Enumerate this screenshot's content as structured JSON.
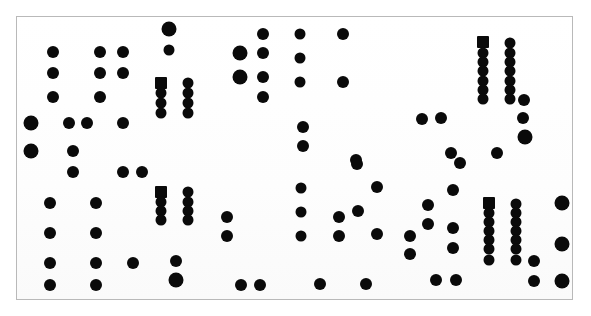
{
  "figure": {
    "type": "scatter-dot-plot",
    "background_color": "#ffffff",
    "frame_color": "#b9b9b9",
    "mark_color": "#0a0a0a",
    "frame": {
      "x": 16,
      "y": 16,
      "width": 557,
      "height": 284
    }
  },
  "chart_data": {
    "type": "scatter",
    "title": "",
    "subtitle": "",
    "xlabel": "",
    "ylabel": "",
    "xlim": [
      0,
      591
    ],
    "ylim": [
      0,
      316
    ],
    "grid": false,
    "legend": "none",
    "annotations": [],
    "tick_labels": {
      "x": [],
      "y": []
    },
    "marker_shapes": [
      "circle",
      "square"
    ],
    "marker_sizes_px": {
      "small": 9,
      "medium": 12,
      "large": 16
    },
    "point_count": 118,
    "points": [
      {
        "x": 53,
        "y": 52,
        "r": 6,
        "shape": "circle"
      },
      {
        "x": 100,
        "y": 52,
        "r": 6,
        "shape": "circle"
      },
      {
        "x": 123,
        "y": 52,
        "r": 6,
        "shape": "circle"
      },
      {
        "x": 169,
        "y": 29,
        "r": 7.5,
        "shape": "circle"
      },
      {
        "x": 169,
        "y": 50,
        "r": 5.5,
        "shape": "circle"
      },
      {
        "x": 240,
        "y": 53,
        "r": 7.5,
        "shape": "circle"
      },
      {
        "x": 263,
        "y": 34,
        "r": 6,
        "shape": "circle"
      },
      {
        "x": 263,
        "y": 53,
        "r": 6,
        "shape": "circle"
      },
      {
        "x": 300,
        "y": 34,
        "r": 5.5,
        "shape": "circle"
      },
      {
        "x": 343,
        "y": 34,
        "r": 6,
        "shape": "circle"
      },
      {
        "x": 483,
        "y": 42,
        "r": 6,
        "shape": "square"
      },
      {
        "x": 510,
        "y": 43,
        "r": 5.5,
        "shape": "circle"
      },
      {
        "x": 53,
        "y": 73,
        "r": 6,
        "shape": "circle"
      },
      {
        "x": 100,
        "y": 73,
        "r": 6,
        "shape": "circle"
      },
      {
        "x": 123,
        "y": 73,
        "r": 6,
        "shape": "circle"
      },
      {
        "x": 240,
        "y": 77,
        "r": 7.5,
        "shape": "circle"
      },
      {
        "x": 263,
        "y": 77,
        "r": 6,
        "shape": "circle"
      },
      {
        "x": 300,
        "y": 58,
        "r": 5.5,
        "shape": "circle"
      },
      {
        "x": 483,
        "y": 53,
        "r": 5.5,
        "shape": "circle"
      },
      {
        "x": 510,
        "y": 53,
        "r": 5.5,
        "shape": "circle"
      },
      {
        "x": 161,
        "y": 83,
        "r": 6,
        "shape": "square"
      },
      {
        "x": 188,
        "y": 83,
        "r": 5.5,
        "shape": "circle"
      },
      {
        "x": 300,
        "y": 82,
        "r": 5.5,
        "shape": "circle"
      },
      {
        "x": 343,
        "y": 82,
        "r": 6,
        "shape": "circle"
      },
      {
        "x": 483,
        "y": 62,
        "r": 5.5,
        "shape": "circle"
      },
      {
        "x": 510,
        "y": 62,
        "r": 5.5,
        "shape": "circle"
      },
      {
        "x": 53,
        "y": 97,
        "r": 6,
        "shape": "circle"
      },
      {
        "x": 100,
        "y": 97,
        "r": 6,
        "shape": "circle"
      },
      {
        "x": 161,
        "y": 93,
        "r": 5.5,
        "shape": "circle"
      },
      {
        "x": 188,
        "y": 93,
        "r": 5.5,
        "shape": "circle"
      },
      {
        "x": 263,
        "y": 97,
        "r": 6,
        "shape": "circle"
      },
      {
        "x": 483,
        "y": 71,
        "r": 5.5,
        "shape": "circle"
      },
      {
        "x": 510,
        "y": 71,
        "r": 5.5,
        "shape": "circle"
      },
      {
        "x": 161,
        "y": 103,
        "r": 5.5,
        "shape": "circle"
      },
      {
        "x": 188,
        "y": 103,
        "r": 5.5,
        "shape": "circle"
      },
      {
        "x": 483,
        "y": 81,
        "r": 5.5,
        "shape": "circle"
      },
      {
        "x": 510,
        "y": 81,
        "r": 5.5,
        "shape": "circle"
      },
      {
        "x": 161,
        "y": 113,
        "r": 5.5,
        "shape": "circle"
      },
      {
        "x": 188,
        "y": 113,
        "r": 5.5,
        "shape": "circle"
      },
      {
        "x": 483,
        "y": 90,
        "r": 5.5,
        "shape": "circle"
      },
      {
        "x": 510,
        "y": 90,
        "r": 5.5,
        "shape": "circle"
      },
      {
        "x": 31,
        "y": 123,
        "r": 7.5,
        "shape": "circle"
      },
      {
        "x": 69,
        "y": 123,
        "r": 6,
        "shape": "circle"
      },
      {
        "x": 87,
        "y": 123,
        "r": 6,
        "shape": "circle"
      },
      {
        "x": 123,
        "y": 123,
        "r": 6,
        "shape": "circle"
      },
      {
        "x": 303,
        "y": 127,
        "r": 6,
        "shape": "circle"
      },
      {
        "x": 422,
        "y": 119,
        "r": 6,
        "shape": "circle"
      },
      {
        "x": 441,
        "y": 118,
        "r": 6,
        "shape": "circle"
      },
      {
        "x": 483,
        "y": 99,
        "r": 5.5,
        "shape": "circle"
      },
      {
        "x": 510,
        "y": 99,
        "r": 5.5,
        "shape": "circle"
      },
      {
        "x": 524,
        "y": 100,
        "r": 6,
        "shape": "circle"
      },
      {
        "x": 31,
        "y": 151,
        "r": 7.5,
        "shape": "circle"
      },
      {
        "x": 73,
        "y": 151,
        "r": 6,
        "shape": "circle"
      },
      {
        "x": 303,
        "y": 146,
        "r": 6,
        "shape": "circle"
      },
      {
        "x": 356,
        "y": 160,
        "r": 6,
        "shape": "circle"
      },
      {
        "x": 451,
        "y": 153,
        "r": 6,
        "shape": "circle"
      },
      {
        "x": 497,
        "y": 153,
        "r": 6,
        "shape": "circle"
      },
      {
        "x": 523,
        "y": 118,
        "r": 6,
        "shape": "circle"
      },
      {
        "x": 525,
        "y": 137,
        "r": 7.5,
        "shape": "circle"
      },
      {
        "x": 73,
        "y": 172,
        "r": 6,
        "shape": "circle"
      },
      {
        "x": 123,
        "y": 172,
        "r": 6,
        "shape": "circle"
      },
      {
        "x": 142,
        "y": 172,
        "r": 6,
        "shape": "circle"
      },
      {
        "x": 357,
        "y": 164,
        "r": 6,
        "shape": "circle"
      },
      {
        "x": 460,
        "y": 163,
        "r": 6,
        "shape": "circle"
      },
      {
        "x": 50,
        "y": 203,
        "r": 6,
        "shape": "circle"
      },
      {
        "x": 96,
        "y": 203,
        "r": 6,
        "shape": "circle"
      },
      {
        "x": 161,
        "y": 192,
        "r": 6,
        "shape": "square"
      },
      {
        "x": 188,
        "y": 192,
        "r": 5.5,
        "shape": "circle"
      },
      {
        "x": 301,
        "y": 188,
        "r": 5.5,
        "shape": "circle"
      },
      {
        "x": 377,
        "y": 187,
        "r": 6,
        "shape": "circle"
      },
      {
        "x": 489,
        "y": 203,
        "r": 6,
        "shape": "square"
      },
      {
        "x": 516,
        "y": 204,
        "r": 5.5,
        "shape": "circle"
      },
      {
        "x": 562,
        "y": 203,
        "r": 7.5,
        "shape": "circle"
      },
      {
        "x": 453,
        "y": 190,
        "r": 6,
        "shape": "circle"
      },
      {
        "x": 161,
        "y": 202,
        "r": 5.5,
        "shape": "circle"
      },
      {
        "x": 188,
        "y": 202,
        "r": 5.5,
        "shape": "circle"
      },
      {
        "x": 358,
        "y": 211,
        "r": 6,
        "shape": "circle"
      },
      {
        "x": 339,
        "y": 217,
        "r": 6,
        "shape": "circle"
      },
      {
        "x": 227,
        "y": 217,
        "r": 6,
        "shape": "circle"
      },
      {
        "x": 428,
        "y": 205,
        "r": 6,
        "shape": "circle"
      },
      {
        "x": 489,
        "y": 213,
        "r": 5.5,
        "shape": "circle"
      },
      {
        "x": 516,
        "y": 213,
        "r": 5.5,
        "shape": "circle"
      },
      {
        "x": 50,
        "y": 233,
        "r": 6,
        "shape": "circle"
      },
      {
        "x": 96,
        "y": 233,
        "r": 6,
        "shape": "circle"
      },
      {
        "x": 161,
        "y": 211,
        "r": 5.5,
        "shape": "circle"
      },
      {
        "x": 188,
        "y": 211,
        "r": 5.5,
        "shape": "circle"
      },
      {
        "x": 301,
        "y": 212,
        "r": 5.5,
        "shape": "circle"
      },
      {
        "x": 489,
        "y": 222,
        "r": 5.5,
        "shape": "circle"
      },
      {
        "x": 516,
        "y": 222,
        "r": 5.5,
        "shape": "circle"
      },
      {
        "x": 161,
        "y": 220,
        "r": 5.5,
        "shape": "circle"
      },
      {
        "x": 188,
        "y": 220,
        "r": 5.5,
        "shape": "circle"
      },
      {
        "x": 227,
        "y": 236,
        "r": 6,
        "shape": "circle"
      },
      {
        "x": 301,
        "y": 236,
        "r": 5.5,
        "shape": "circle"
      },
      {
        "x": 339,
        "y": 236,
        "r": 6,
        "shape": "circle"
      },
      {
        "x": 377,
        "y": 234,
        "r": 6,
        "shape": "circle"
      },
      {
        "x": 410,
        "y": 236,
        "r": 6,
        "shape": "circle"
      },
      {
        "x": 428,
        "y": 224,
        "r": 6,
        "shape": "circle"
      },
      {
        "x": 453,
        "y": 228,
        "r": 6,
        "shape": "circle"
      },
      {
        "x": 489,
        "y": 231,
        "r": 5.5,
        "shape": "circle"
      },
      {
        "x": 516,
        "y": 231,
        "r": 5.5,
        "shape": "circle"
      },
      {
        "x": 50,
        "y": 263,
        "r": 6,
        "shape": "circle"
      },
      {
        "x": 96,
        "y": 263,
        "r": 6,
        "shape": "circle"
      },
      {
        "x": 133,
        "y": 263,
        "r": 6,
        "shape": "circle"
      },
      {
        "x": 176,
        "y": 261,
        "r": 6,
        "shape": "circle"
      },
      {
        "x": 410,
        "y": 254,
        "r": 6,
        "shape": "circle"
      },
      {
        "x": 453,
        "y": 248,
        "r": 6,
        "shape": "circle"
      },
      {
        "x": 489,
        "y": 240,
        "r": 5.5,
        "shape": "circle"
      },
      {
        "x": 516,
        "y": 240,
        "r": 5.5,
        "shape": "circle"
      },
      {
        "x": 562,
        "y": 244,
        "r": 7.5,
        "shape": "circle"
      },
      {
        "x": 489,
        "y": 249,
        "r": 5.5,
        "shape": "circle"
      },
      {
        "x": 516,
        "y": 249,
        "r": 5.5,
        "shape": "circle"
      },
      {
        "x": 489,
        "y": 260,
        "r": 5.5,
        "shape": "circle"
      },
      {
        "x": 516,
        "y": 260,
        "r": 5.5,
        "shape": "circle"
      },
      {
        "x": 534,
        "y": 261,
        "r": 6,
        "shape": "circle"
      },
      {
        "x": 50,
        "y": 285,
        "r": 6,
        "shape": "circle"
      },
      {
        "x": 96,
        "y": 285,
        "r": 6,
        "shape": "circle"
      },
      {
        "x": 176,
        "y": 280,
        "r": 7.5,
        "shape": "circle"
      },
      {
        "x": 241,
        "y": 285,
        "r": 6,
        "shape": "circle"
      },
      {
        "x": 260,
        "y": 285,
        "r": 6,
        "shape": "circle"
      },
      {
        "x": 320,
        "y": 284,
        "r": 6,
        "shape": "circle"
      },
      {
        "x": 366,
        "y": 284,
        "r": 6,
        "shape": "circle"
      },
      {
        "x": 436,
        "y": 280,
        "r": 6,
        "shape": "circle"
      },
      {
        "x": 456,
        "y": 280,
        "r": 6,
        "shape": "circle"
      },
      {
        "x": 534,
        "y": 281,
        "r": 6,
        "shape": "circle"
      },
      {
        "x": 562,
        "y": 281,
        "r": 7.5,
        "shape": "circle"
      }
    ]
  }
}
